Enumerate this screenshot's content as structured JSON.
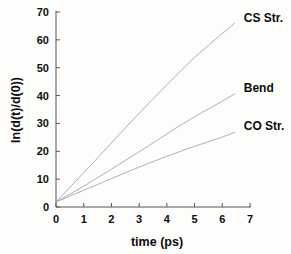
{
  "chart_data": {
    "type": "line",
    "title": "",
    "xlabel": "time (ps)",
    "ylabel": "ln(d(t)/d(0))",
    "xlim": [
      0,
      7
    ],
    "ylim": [
      0,
      70
    ],
    "xticks": [
      "0",
      "1",
      "2",
      "3",
      "4",
      "5",
      "6",
      "7"
    ],
    "yticks": [
      "0",
      "10",
      "20",
      "30",
      "40",
      "50",
      "60",
      "70"
    ],
    "grid": false,
    "legend_position": "inline-right-of-curve-ends",
    "line_color": "#a6a6a6",
    "text_color": "#0c0c0c",
    "axis_color": "#555555",
    "background_color": "#fdfdfc",
    "series": [
      {
        "name": "CS Str.",
        "label": "CS Str.",
        "x": [
          0.0,
          0.5,
          1.0,
          1.5,
          2.0,
          2.5,
          3.0,
          3.5,
          4.0,
          4.5,
          5.0,
          5.5,
          6.0,
          6.45
        ],
        "values": [
          1.8,
          7.0,
          12.3,
          17.6,
          23.0,
          28.4,
          33.6,
          38.8,
          43.9,
          48.9,
          53.7,
          58.0,
          62.3,
          66.0
        ]
      },
      {
        "name": "Bend",
        "label": "Bend",
        "x": [
          0.0,
          0.5,
          1.0,
          1.5,
          2.0,
          2.5,
          3.0,
          3.5,
          4.0,
          4.5,
          5.0,
          5.5,
          6.0,
          6.45
        ],
        "values": [
          1.8,
          4.6,
          7.5,
          10.5,
          13.6,
          16.7,
          19.8,
          23.0,
          26.2,
          29.4,
          32.4,
          35.2,
          38.0,
          40.6
        ]
      },
      {
        "name": "CO Str.",
        "label": "CO Str.",
        "x": [
          0.0,
          0.5,
          1.0,
          1.5,
          2.0,
          2.5,
          3.0,
          3.5,
          4.0,
          4.5,
          5.0,
          5.5,
          6.0,
          6.45
        ],
        "values": [
          1.8,
          3.9,
          6.0,
          8.1,
          10.2,
          12.3,
          14.3,
          16.3,
          18.2,
          20.0,
          21.8,
          23.4,
          25.1,
          26.8
        ]
      }
    ]
  },
  "labels": {
    "cs_str": "CS Str.",
    "bend": "Bend",
    "co_str": "CO Str."
  }
}
